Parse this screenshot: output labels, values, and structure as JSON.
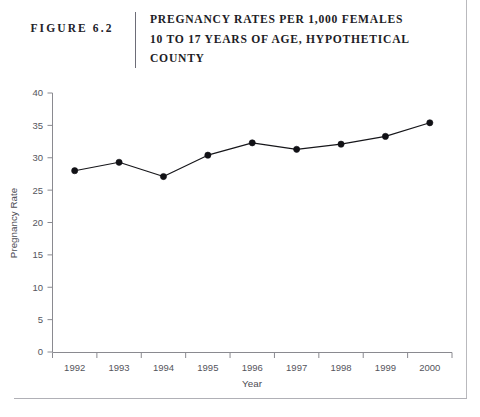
{
  "figure": {
    "number_label": "FIGURE 6.2",
    "title_lines": [
      "PREGNANCY RATES PER 1,000 FEMALES",
      "10 TO 17 YEARS OF AGE, HYPOTHETICAL",
      "COUNTY"
    ]
  },
  "chart_data": {
    "type": "line",
    "title": "PREGNANCY RATES PER 1,000 FEMALES 10 TO 17 YEARS OF AGE, HYPOTHETICAL COUNTY",
    "xlabel": "Year",
    "ylabel": "Pregnancy Rate",
    "categories": [
      "1992",
      "1993",
      "1994",
      "1995",
      "1996",
      "1997",
      "1998",
      "1999",
      "2000"
    ],
    "values": [
      28.0,
      29.3,
      27.1,
      30.4,
      32.3,
      31.3,
      32.1,
      33.3,
      35.4
    ],
    "x": [
      1992,
      1993,
      1994,
      1995,
      1996,
      1997,
      1998,
      1999,
      2000
    ],
    "ylim": [
      0,
      40
    ],
    "xlim": [
      1991.5,
      2000.5
    ],
    "y_ticks": [
      "0",
      "5",
      "10",
      "15",
      "20",
      "25",
      "30",
      "35",
      "40"
    ],
    "y_tick_values": [
      0,
      5,
      10,
      15,
      20,
      25,
      30,
      35,
      40
    ],
    "x_ticks": [
      "1992",
      "1993",
      "1994",
      "1995",
      "1996",
      "1997",
      "1998",
      "1999",
      "2000"
    ],
    "grid": false,
    "legend": null,
    "marker": "filled-circle",
    "series_color": "#111115",
    "axis_color": "#8a8a90"
  },
  "colors": {
    "ink": "#1a1a1a",
    "axis": "#8a8a90",
    "tick_text": "#55555c",
    "series": "#111115",
    "page_rule": "#b9b9bd"
  }
}
